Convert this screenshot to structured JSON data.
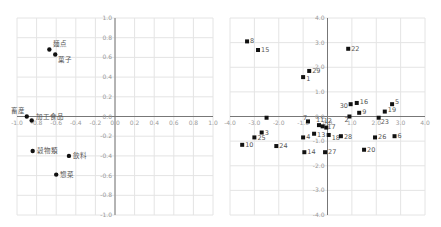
{
  "chart_data": [
    {
      "type": "scatter",
      "title": "",
      "xlabel": "",
      "ylabel": "",
      "xlim": [
        -1.0,
        1.0
      ],
      "ylim": [
        -1.0,
        1.0
      ],
      "grid": true,
      "marker": "circle",
      "x_ticks": [
        "-1.0",
        "-0.8",
        "-0.6",
        "-0.4",
        "-0.2",
        "0.0",
        "0.2",
        "0.4",
        "0.6",
        "0.8",
        "1.0"
      ],
      "y_ticks": [
        "1.0",
        "0.8",
        "0.6",
        "0.4",
        "0.2",
        "0.0",
        "-0.2",
        "-0.4",
        "-0.6",
        "-0.8",
        "-1.0"
      ],
      "points": [
        {
          "label": "麺点",
          "x": -0.67,
          "y": 0.68,
          "lx": 4,
          "ly": -4
        },
        {
          "label": "菓子",
          "x": -0.61,
          "y": 0.63,
          "lx": 3,
          "ly": 8
        },
        {
          "label": "畜産",
          "x": -0.9,
          "y": 0.0,
          "lx": -16,
          "ly": -4
        },
        {
          "label": "加工食品",
          "x": -0.85,
          "y": -0.04,
          "lx": 4,
          "ly": -1
        },
        {
          "label": "穀物類",
          "x": -0.84,
          "y": -0.35,
          "lx": 4,
          "ly": 2
        },
        {
          "label": "飲料",
          "x": -0.47,
          "y": -0.4,
          "lx": 4,
          "ly": 2
        },
        {
          "label": "惣菜",
          "x": -0.6,
          "y": -0.59,
          "lx": 4,
          "ly": 2
        }
      ]
    },
    {
      "type": "scatter",
      "title": "",
      "xlabel": "",
      "ylabel": "",
      "xlim": [
        -4.0,
        4.0
      ],
      "ylim": [
        -4.0,
        4.0
      ],
      "grid": true,
      "marker": "square",
      "x_ticks": [
        "-4.0",
        "-3.0",
        "-2.0",
        "-1.0",
        "0.0",
        "1.0",
        "2.0",
        "3.0",
        "4.0"
      ],
      "y_ticks": [
        "4.0",
        "3.0",
        "2.0",
        "1.0",
        "0.0",
        "-1.0",
        "-2.0",
        "-3.0",
        "-4.0"
      ],
      "points": [
        {
          "label": "8",
          "x": -3.3,
          "y": 3.05,
          "lx": 3,
          "ly": 2
        },
        {
          "label": "15",
          "x": -2.85,
          "y": 2.7,
          "lx": 3,
          "ly": 2
        },
        {
          "label": "22",
          "x": 0.85,
          "y": 2.75,
          "lx": 3,
          "ly": 2
        },
        {
          "label": "29",
          "x": -0.75,
          "y": 1.85,
          "lx": 3,
          "ly": 2
        },
        {
          "label": "1",
          "x": -1.0,
          "y": 1.6,
          "lx": 3,
          "ly": 4
        },
        {
          "label": "30",
          "x": 0.95,
          "y": 0.5,
          "lx": -11,
          "ly": 4
        },
        {
          "label": "16",
          "x": 1.2,
          "y": 0.55,
          "lx": 3,
          "ly": 1
        },
        {
          "label": "5",
          "x": 2.65,
          "y": 0.5,
          "lx": 3,
          "ly": 0
        },
        {
          "label": "19",
          "x": 2.35,
          "y": 0.2,
          "lx": 3,
          "ly": 0
        },
        {
          "label": "9",
          "x": 1.3,
          "y": 0.15,
          "lx": 3,
          "ly": 1
        },
        {
          "label": "2",
          "x": 0.9,
          "y": 0.0,
          "lx": -5,
          "ly": 5
        },
        {
          "label": "23",
          "x": 2.1,
          "y": -0.05,
          "lx": 2,
          "ly": 6
        },
        {
          "label": "",
          "x": -2.5,
          "y": -0.05,
          "lx": 0,
          "ly": 0
        },
        {
          "label": "7",
          "x": -0.8,
          "y": -0.2,
          "lx": -5,
          "ly": -1
        },
        {
          "label": "11",
          "x": -0.35,
          "y": -0.35,
          "lx": -3,
          "ly": -3
        },
        {
          "label": "12",
          "x": -0.2,
          "y": -0.4,
          "lx": 1,
          "ly": -3
        },
        {
          "label": "17",
          "x": -0.05,
          "y": -0.45,
          "lx": 1,
          "ly": 1
        },
        {
          "label": "3",
          "x": -2.7,
          "y": -0.65,
          "lx": 3,
          "ly": 2
        },
        {
          "label": "13",
          "x": -0.55,
          "y": -0.7,
          "lx": 3,
          "ly": 3
        },
        {
          "label": "18",
          "x": 0.05,
          "y": -0.75,
          "lx": 3,
          "ly": 5
        },
        {
          "label": "28",
          "x": 0.55,
          "y": -0.8,
          "lx": 3,
          "ly": 3
        },
        {
          "label": "6",
          "x": 2.75,
          "y": -0.8,
          "lx": 3,
          "ly": 2
        },
        {
          "label": "25",
          "x": -3.0,
          "y": -0.85,
          "lx": 3,
          "ly": 3
        },
        {
          "label": "4",
          "x": -1.0,
          "y": -0.85,
          "lx": 3,
          "ly": 2
        },
        {
          "label": "26",
          "x": 1.95,
          "y": -0.85,
          "lx": 3,
          "ly": 2
        },
        {
          "label": "10",
          "x": -3.5,
          "y": -1.15,
          "lx": 3,
          "ly": 2
        },
        {
          "label": "24",
          "x": -2.1,
          "y": -1.2,
          "lx": 3,
          "ly": 2
        },
        {
          "label": "20",
          "x": 1.5,
          "y": -1.35,
          "lx": 3,
          "ly": 2
        },
        {
          "label": "14",
          "x": -0.95,
          "y": -1.45,
          "lx": 3,
          "ly": 2
        },
        {
          "label": "27",
          "x": -0.1,
          "y": -1.45,
          "lx": 3,
          "ly": 2
        }
      ]
    }
  ],
  "colors": {
    "grid": "#e4e4e4",
    "axis": "#777777",
    "tick": "#9a9a9a",
    "marker": "#111111",
    "label": "#555555"
  }
}
